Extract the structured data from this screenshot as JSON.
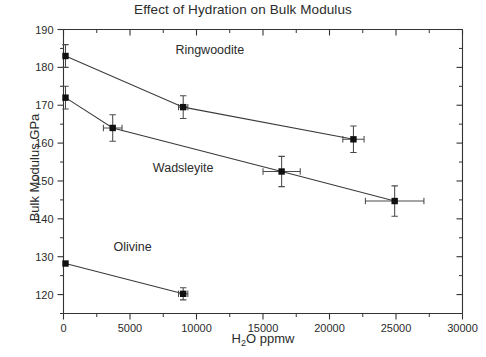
{
  "chart_data": {
    "type": "scatter",
    "title": "Effect of Hydration on Bulk Modulus",
    "xlabel": "H2O ppmw",
    "xlabel_parts": {
      "pre": "H",
      "sub": "2",
      "post": "O ppmw"
    },
    "ylabel": "Bulk Modulus GPa",
    "xlim": [
      0,
      30000
    ],
    "ylim": [
      115,
      190
    ],
    "xticks": [
      0,
      5000,
      10000,
      15000,
      20000,
      25000,
      30000
    ],
    "xtick_labels": [
      "0",
      "5000",
      "10000",
      "15000",
      "20000",
      "25000",
      "30000"
    ],
    "yticks": [
      120,
      130,
      140,
      150,
      160,
      170,
      180,
      190
    ],
    "ytick_labels": [
      "120",
      "130",
      "140",
      "150",
      "160",
      "170",
      "180",
      "190"
    ],
    "x_minor_interval": 2500,
    "y_minor_interval": 5,
    "grid": false,
    "legend": "inline-annotations",
    "marker": "filled-square",
    "series": [
      {
        "name": "Ringwoodite",
        "color": "#101010",
        "label_position": {
          "x": 11000,
          "y": 183.5
        },
        "points": [
          {
            "x": 150,
            "y": 183.0,
            "yerr": 3.0,
            "xerr": 0
          },
          {
            "x": 9000,
            "y": 169.5,
            "yerr": 3.0,
            "xerr": 350
          },
          {
            "x": 21800,
            "y": 161.0,
            "yerr": 3.5,
            "xerr": 800
          }
        ]
      },
      {
        "name": "Wadsleyite",
        "color": "#101010",
        "label_position": {
          "x": 9000,
          "y": 152.5
        },
        "points": [
          {
            "x": 150,
            "y": 172.0,
            "yerr": 3.0,
            "xerr": 0
          },
          {
            "x": 3700,
            "y": 164.0,
            "yerr": 3.5,
            "xerr": 700
          },
          {
            "x": 16400,
            "y": 152.5,
            "yerr": 4.0,
            "xerr": 1400
          },
          {
            "x": 24900,
            "y": 144.7,
            "yerr": 4.0,
            "xerr": 2200
          }
        ]
      },
      {
        "name": "Olivine",
        "color": "#101010",
        "label_position": {
          "x": 5200,
          "y": 131.5
        },
        "points": [
          {
            "x": 150,
            "y": 128.2,
            "yerr": 0,
            "xerr": 0
          },
          {
            "x": 9000,
            "y": 120.2,
            "yerr": 1.6,
            "xerr": 350
          }
        ]
      }
    ]
  }
}
